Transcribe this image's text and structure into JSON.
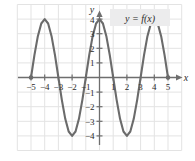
{
  "figure": {
    "curve_label": "y = f(x)",
    "x_axis_name": "x",
    "y_axis_name": "y",
    "colors": {
      "curve": "#6b6b6b",
      "axis": "#6e6e6e",
      "grid": "#e3e3e3",
      "text": "#2b2b2b",
      "label_box": "#ececed",
      "background": "#ffffff"
    }
  },
  "chart_data": {
    "type": "line",
    "title": "",
    "xlabel": "x",
    "ylabel": "y",
    "legend": [
      "y = f(x)"
    ],
    "legend_position": "top-right",
    "grid": true,
    "xlim": [
      -5.6,
      5.6
    ],
    "ylim": [
      -4.8,
      4.8
    ],
    "xticks": [
      -5,
      -4,
      -3,
      -2,
      -1,
      1,
      2,
      3,
      4,
      5
    ],
    "xtick_labels": [
      "-5",
      "-4",
      "-3",
      "-2",
      "-1",
      "1",
      "2",
      "3",
      "4",
      "5"
    ],
    "yticks": [
      -4,
      -3,
      -2,
      -1,
      1,
      2,
      3,
      4
    ],
    "ytick_labels": [
      "-4",
      "-3",
      "-2",
      "-1",
      "1",
      "2",
      "3",
      "4"
    ],
    "function": "y = 4 cos(pi x / 2)",
    "amplitude": 4,
    "period": 4,
    "domain": [
      -5,
      5
    ],
    "zeros": [
      -5,
      -3,
      -1,
      1,
      3,
      5
    ],
    "maxima": [
      {
        "x": -4,
        "y": 4
      },
      {
        "x": 0,
        "y": 4
      },
      {
        "x": 4,
        "y": 4
      }
    ],
    "minima": [
      {
        "x": -2,
        "y": -4
      },
      {
        "x": 2,
        "y": -4
      }
    ],
    "endpoints": [
      {
        "x": -5,
        "y": 0
      },
      {
        "x": 5,
        "y": 0
      }
    ],
    "x": [
      -5,
      -4.75,
      -4.5,
      -4.25,
      -4,
      -3.75,
      -3.5,
      -3.25,
      -3,
      -2.75,
      -2.5,
      -2.25,
      -2,
      -1.75,
      -1.5,
      -1.25,
      -1,
      -0.75,
      -0.5,
      -0.25,
      0,
      0.25,
      0.5,
      0.75,
      1,
      1.25,
      1.5,
      1.75,
      2,
      2.25,
      2.5,
      2.75,
      3,
      3.25,
      3.5,
      3.75,
      4,
      4.25,
      4.5,
      4.75,
      5
    ],
    "values": [
      0,
      1.53,
      2.83,
      3.7,
      4,
      3.7,
      2.83,
      1.53,
      0,
      -1.53,
      -2.83,
      -3.7,
      -4,
      -3.7,
      -2.83,
      -1.53,
      0,
      1.53,
      2.83,
      3.7,
      4,
      3.7,
      2.83,
      1.53,
      0,
      -1.53,
      -2.83,
      -3.7,
      -4,
      -3.7,
      -2.83,
      -1.53,
      0,
      1.53,
      2.83,
      3.7,
      4,
      3.7,
      2.83,
      1.53,
      0
    ]
  }
}
